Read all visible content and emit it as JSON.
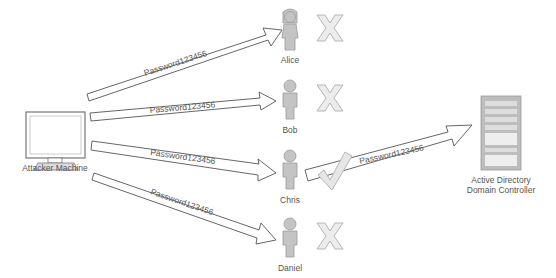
{
  "diagram": {
    "attacker": {
      "label": "Attacker Machine",
      "icon": "computer-icon"
    },
    "target": {
      "label_line1": "Active Directory",
      "label_line2": "Domain Controller",
      "icon": "server-rack-icon"
    },
    "users": [
      {
        "name": "Alice",
        "icon": "user-female-icon",
        "result": "fail",
        "result_icon": "x-mark-icon"
      },
      {
        "name": "Bob",
        "icon": "user-icon",
        "result": "fail",
        "result_icon": "x-mark-icon"
      },
      {
        "name": "Chris",
        "icon": "user-icon",
        "result": "success",
        "result_icon": "check-mark-icon"
      },
      {
        "name": "Daniel",
        "icon": "user-icon",
        "result": "fail",
        "result_icon": "x-mark-icon"
      }
    ],
    "arrows": [
      {
        "from": "Attacker Machine",
        "to": "Alice",
        "label": "Password123456"
      },
      {
        "from": "Attacker Machine",
        "to": "Bob",
        "label": "Password123456"
      },
      {
        "from": "Attacker Machine",
        "to": "Chris",
        "label": "Password123456"
      },
      {
        "from": "Attacker Machine",
        "to": "Daniel",
        "label": "Password123456"
      },
      {
        "from": "Chris",
        "to": "Active Directory Domain Controller",
        "label": "Password123456"
      }
    ],
    "colors": {
      "stroke": "#555555",
      "icon_fill": "#bdbdbd",
      "icon_stroke": "#9a9a9a",
      "mark_fill": "#e6e6e6"
    }
  }
}
